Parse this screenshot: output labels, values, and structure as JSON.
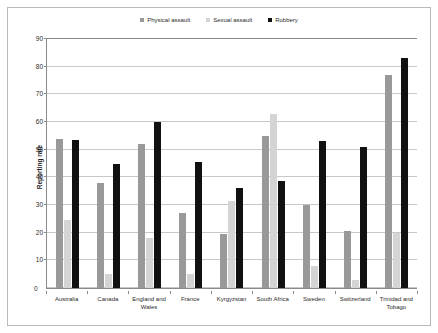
{
  "chart_data": {
    "type": "bar",
    "title": "",
    "xlabel": "",
    "ylabel": "Reporting rate",
    "ylim": [
      0,
      90
    ],
    "yticks": [
      0,
      10,
      20,
      30,
      40,
      50,
      60,
      70,
      80,
      90
    ],
    "grid": true,
    "legend_position": "top-center",
    "categories": [
      "Australia",
      "Canada",
      "England and\nWales",
      "France",
      "Kyrgyzstan",
      "South Africa",
      "Sweden",
      "Switzerland",
      "Trinidad and\nTobago"
    ],
    "series": [
      {
        "name": "Physical assault",
        "color": "#999999",
        "values": [
          54,
          38,
          52,
          27,
          19.5,
          55,
          30,
          20.5,
          77
        ]
      },
      {
        "name": "Sexual assault",
        "color": "#d4d4d4",
        "values": [
          24.5,
          5,
          18,
          5,
          31.5,
          63,
          8,
          3,
          20
        ]
      },
      {
        "name": "Robbery",
        "color": "#111111",
        "values": [
          53.5,
          45,
          60,
          45.5,
          36,
          38.5,
          53,
          51,
          83
        ]
      }
    ]
  },
  "legend": {
    "items": [
      {
        "label": "Physical assault"
      },
      {
        "label": "Sexual assault"
      },
      {
        "label": "Robbery"
      }
    ]
  },
  "axis": {
    "y_label": "Reporting rate",
    "y_ticks": [
      "90",
      "80",
      "70",
      "60",
      "50",
      "40",
      "30",
      "20",
      "10",
      "0"
    ],
    "zero": "0"
  }
}
